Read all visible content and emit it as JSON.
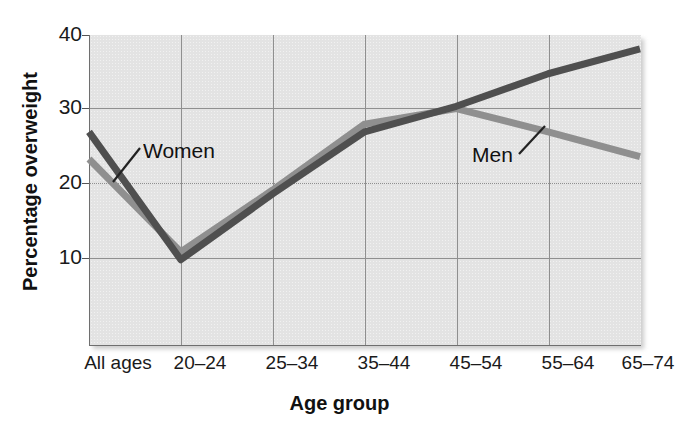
{
  "chart_data": {
    "type": "line",
    "title": "",
    "xlabel": "Age group",
    "ylabel": "Percentage overweight",
    "categories": [
      "All ages",
      "20–24",
      "25–34",
      "35–44",
      "45–54",
      "55–64",
      "65–74"
    ],
    "yticks": [
      10,
      20,
      30,
      40
    ],
    "ylim": [
      0,
      40
    ],
    "grid": true,
    "legend_position": "inline-annotations",
    "series": [
      {
        "name": "Women",
        "color": "#4f4f4f",
        "values": [
          27.5,
          11.0,
          19.5,
          27.5,
          30.8,
          35.0,
          38.2
        ]
      },
      {
        "name": "Men",
        "color": "#8f8f8f",
        "values": [
          24.0,
          12.0,
          20.0,
          28.5,
          30.5,
          27.5,
          24.3
        ]
      }
    ],
    "annotations": [
      {
        "text": "Women",
        "series": "Women"
      },
      {
        "text": "Men",
        "series": "Men"
      }
    ]
  },
  "axes": {
    "y_title": "Percentage overweight",
    "x_title": "Age group",
    "y_tick_labels": [
      "40",
      "30",
      "20",
      "10"
    ],
    "x_tick_labels": [
      "All ages",
      "20–24",
      "25–34",
      "35–44",
      "45–54",
      "55–64",
      "65–74"
    ]
  },
  "labels": {
    "women": "Women",
    "men": "Men"
  },
  "colors": {
    "women_line": "#4f4f4f",
    "men_line": "#8f8f8f",
    "panel_background": "#e3e3e3",
    "gridline": "#8f8f8f",
    "text": "#1a1a1a"
  }
}
